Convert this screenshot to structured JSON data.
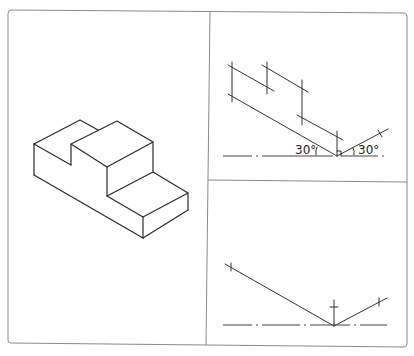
{
  "figure": {
    "panels": [
      {
        "id": "isometric-view",
        "description": "Isometric drawing of stepped block"
      },
      {
        "id": "construction-top",
        "description": "Isometric construction lines with 30 degree angles"
      },
      {
        "id": "construction-bottom",
        "description": "Isometric axes construction"
      }
    ],
    "angle_labels": {
      "left": "30°",
      "right": "30°"
    },
    "colors": {
      "line": "#2a2a2a",
      "frame": "#8a8a8a",
      "background": "#ffffff"
    }
  }
}
